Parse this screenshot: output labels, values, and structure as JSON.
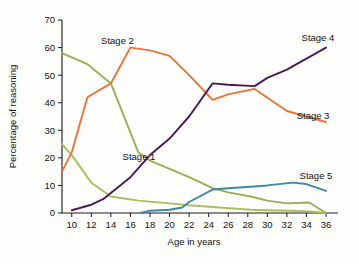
{
  "chart_data": {
    "type": "line",
    "title": "",
    "xlabel": "Age in years",
    "ylabel": "Percentage of reasoning",
    "xlim": [
      9,
      36
    ],
    "ylim": [
      0,
      70
    ],
    "grid": false,
    "legend_position": "inline-labels",
    "x_ticks": [
      10,
      12,
      14,
      16,
      18,
      20,
      22,
      24,
      26,
      28,
      30,
      32,
      34,
      36
    ],
    "y_ticks": [
      0,
      10,
      20,
      30,
      40,
      50,
      60,
      70
    ],
    "x_tick_labels": [
      "10",
      "12",
      "14",
      "16",
      "18",
      "20",
      "22",
      "24",
      "26",
      "28",
      "30",
      "32",
      "34",
      "36"
    ],
    "y_tick_labels": [
      "0",
      "10",
      "20",
      "30",
      "40",
      "50",
      "60",
      "70"
    ],
    "series": [
      {
        "name": "Stage 1",
        "color": "#a9bf5c",
        "label_x": 15.2,
        "label_y": 20.5,
        "x": [
          9,
          10,
          12,
          14,
          16.8,
          20,
          22,
          24.4,
          28.3,
          30,
          32.6,
          34.3,
          36
        ],
        "values": [
          25,
          21,
          11,
          6,
          4.5,
          3.5,
          2.8,
          2.2,
          1.2,
          1.0,
          0.8,
          0.6,
          0
        ]
      },
      {
        "name": "Stage 2",
        "color": "#9aae55",
        "label_x": 13.0,
        "label_y": 62.5,
        "x": [
          9,
          11.6,
          14,
          16.8,
          18,
          20,
          22,
          24.4,
          26,
          28.3,
          30,
          32,
          34.3,
          36
        ],
        "values": [
          58,
          54,
          47,
          22,
          19,
          16,
          13,
          9,
          7.5,
          6,
          4.5,
          3.5,
          3.8,
          0
        ]
      },
      {
        "name": "Stage 3",
        "color": "#e8743b",
        "label_x": 33.0,
        "label_y": 35.5,
        "x": [
          9,
          10,
          11.6,
          14,
          16,
          18,
          20,
          22,
          24.4,
          26,
          28.7,
          32,
          34,
          36
        ],
        "values": [
          15,
          22,
          42,
          47,
          60,
          59,
          57,
          50,
          41,
          43,
          45,
          37,
          35,
          33
        ]
      },
      {
        "name": "Stage 4",
        "color": "#4b1a55",
        "label_x": 33.5,
        "label_y": 63.5,
        "x": [
          10,
          12,
          13.2,
          16,
          18,
          20,
          22,
          24.4,
          26,
          28.7,
          30,
          32,
          34,
          36
        ],
        "values": [
          1,
          3,
          5,
          13,
          21,
          27,
          35,
          47,
          46.5,
          46,
          49,
          52,
          56,
          60
        ]
      },
      {
        "name": "Stage 5",
        "color": "#3f86ab",
        "label_x": 33.3,
        "label_y": 13.5,
        "x": [
          17,
          18,
          20,
          21.3,
          22,
          24.4,
          26,
          28.3,
          30,
          32.6,
          34,
          36
        ],
        "values": [
          0,
          0.8,
          1.2,
          2,
          4,
          8.5,
          9,
          9.5,
          10,
          11,
          10.5,
          8
        ]
      }
    ]
  }
}
